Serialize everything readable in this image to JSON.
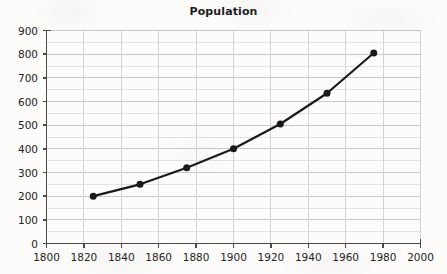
{
  "chart_data": {
    "type": "line",
    "title": "Population",
    "xlabel": "",
    "ylabel": "",
    "grid": true,
    "legend": "none",
    "xlim": [
      1800,
      2000
    ],
    "ylim": [
      0,
      900
    ],
    "xticks": [
      1800,
      1820,
      1840,
      1860,
      1880,
      1900,
      1920,
      1940,
      1960,
      1980,
      2000
    ],
    "yticks": [
      0,
      100,
      200,
      300,
      400,
      500,
      600,
      700,
      800,
      900
    ],
    "xtick_labels": [
      "1800",
      "1820",
      "1840",
      "1860",
      "1880",
      "1900",
      "1920",
      "1940",
      "1960",
      "1980",
      "2000"
    ],
    "ytick_labels": [
      "0",
      "100",
      "200",
      "300",
      "400",
      "500",
      "600",
      "700",
      "800",
      "900"
    ],
    "minor_y_step": 50,
    "x": [
      1825,
      1850,
      1875,
      1900,
      1925,
      1950,
      1975
    ],
    "values": [
      200,
      250,
      320,
      400,
      505,
      635,
      805
    ],
    "marker": "circle",
    "line_color": "#1a1a1a",
    "marker_color": "#1a1a1a",
    "grid_color": "#c9c9c9",
    "axis_color": "#4a4a4a",
    "background_color": "#fdfcfa"
  }
}
